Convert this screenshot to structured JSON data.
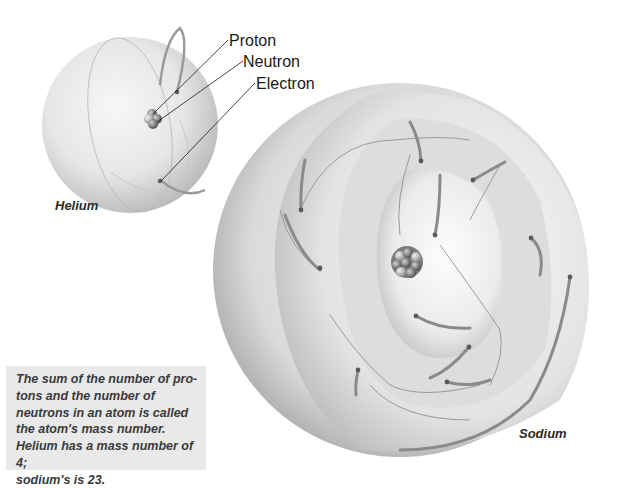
{
  "diagram": {
    "callouts": {
      "proton": "Proton",
      "neutron": "Neutron",
      "electron": "Electron"
    },
    "atoms": [
      {
        "name": "Helium",
        "mass_number": 4,
        "electrons": 2
      },
      {
        "name": "Sodium",
        "mass_number": 23,
        "electrons": 11
      }
    ],
    "caption": "The sum of the number of pro-\ntons and the number of\nneutrons in an atom is called\nthe atom's mass number.\nHelium has a mass number of 4;\nsodium's is 23.",
    "colors": {
      "background": "#ffffff",
      "caption_bg": "#e9e9e9",
      "sphere_light": "#f4f4f4",
      "sphere_dark": "#a8a8a8",
      "nucleus": "#6e6e6e"
    }
  }
}
